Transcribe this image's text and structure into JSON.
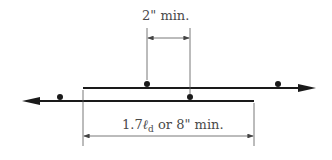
{
  "diagram": {
    "top_dimension": {
      "label": "2\"  min."
    },
    "bottom_dimension": {
      "prefix": "1.7",
      "symbol": "ℓ",
      "subscript": "d",
      "suffix": " or  8\"  min."
    },
    "colors": {
      "bar": "#1a1a1a",
      "dimension_line": "#555555",
      "text": "#4a4a4a"
    }
  }
}
